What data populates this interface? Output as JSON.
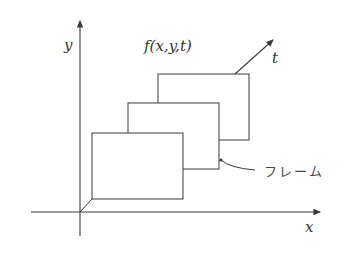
{
  "diagram": {
    "axes": {
      "x_label": "x",
      "y_label": "y",
      "t_label": "t"
    },
    "function_label": "f(x,y,t)",
    "frame_label": "フレーム",
    "frame_count": 3,
    "colors": {
      "line": "#3a3a3a",
      "background": "#ffffff"
    }
  }
}
